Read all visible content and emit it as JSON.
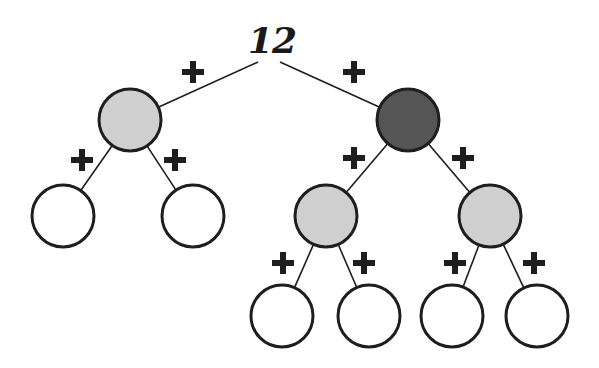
{
  "diagram": {
    "type": "binary-tree",
    "root_label": "12",
    "edge_label": "+",
    "colors": {
      "stroke": "#1e1e1e",
      "light_fill": "#cfcfcf",
      "dark_fill": "#555555",
      "empty_fill": "#ffffff"
    },
    "node_radius": 31,
    "root": {
      "x": 272,
      "y": 40
    },
    "nodes": [
      {
        "id": "n1",
        "x": 130,
        "y": 120,
        "fill": "light"
      },
      {
        "id": "n2",
        "x": 408,
        "y": 120,
        "fill": "dark"
      },
      {
        "id": "n3",
        "x": 63,
        "y": 216,
        "fill": "empty"
      },
      {
        "id": "n4",
        "x": 193,
        "y": 216,
        "fill": "empty"
      },
      {
        "id": "n5",
        "x": 326,
        "y": 216,
        "fill": "light"
      },
      {
        "id": "n6",
        "x": 490,
        "y": 216,
        "fill": "light"
      },
      {
        "id": "n7",
        "x": 282,
        "y": 316,
        "fill": "empty"
      },
      {
        "id": "n8",
        "x": 369,
        "y": 316,
        "fill": "empty"
      },
      {
        "id": "n9",
        "x": 452,
        "y": 316,
        "fill": "empty"
      },
      {
        "id": "n10",
        "x": 537,
        "y": 316,
        "fill": "empty"
      }
    ],
    "edges": [
      {
        "from": [
          258,
          62
        ],
        "to": "n1",
        "plus": [
          193,
          72
        ]
      },
      {
        "from": [
          280,
          62
        ],
        "to": "n2",
        "plus": [
          354,
          72
        ]
      },
      {
        "from": "n1",
        "to": "n3",
        "plus": [
          82,
          160
        ]
      },
      {
        "from": "n1",
        "to": "n4",
        "plus": [
          175,
          160
        ]
      },
      {
        "from": "n2",
        "to": "n5",
        "plus": [
          354,
          158
        ]
      },
      {
        "from": "n2",
        "to": "n6",
        "plus": [
          463,
          158
        ]
      },
      {
        "from": "n5",
        "to": "n7",
        "plus": [
          283,
          263
        ]
      },
      {
        "from": "n5",
        "to": "n8",
        "plus": [
          364,
          263
        ]
      },
      {
        "from": "n6",
        "to": "n9",
        "plus": [
          455,
          263
        ]
      },
      {
        "from": "n6",
        "to": "n10",
        "plus": [
          534,
          263
        ]
      }
    ]
  }
}
